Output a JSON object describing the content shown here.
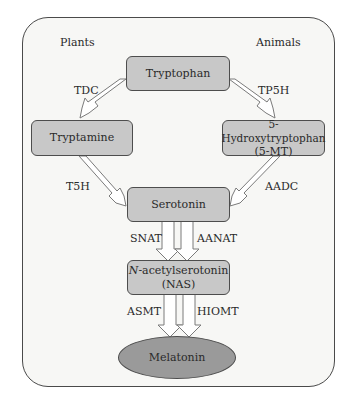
{
  "diagram": {
    "headers": {
      "left": "Plants",
      "right": "Animals"
    },
    "nodes": {
      "tryptophan": "Tryptophan",
      "tryptamine": "Tryptamine",
      "hydroxytryptophan_line1": "5-Hydroxytryptophan",
      "hydroxytryptophan_line2": "(5-MT)",
      "serotonin": "Serotonin",
      "nas_prefix": "N",
      "nas_line1_rest": "-acetylserotonin",
      "nas_line2": "(NAS)",
      "melatonin": "Melatonin"
    },
    "enzymes": {
      "tdc": "TDC",
      "tp5h": "TP5H",
      "t5h": "T5H",
      "aadc": "AADC",
      "snat": "SNAT",
      "aanat": "AANAT",
      "asmt": "ASMT",
      "hiomt": "HIOMT"
    },
    "edges": [
      {
        "from": "Tryptophan",
        "to": "Tryptamine",
        "enzyme": "TDC",
        "side": "Plants"
      },
      {
        "from": "Tryptophan",
        "to": "5-Hydroxytryptophan (5-MT)",
        "enzyme": "TP5H",
        "side": "Animals"
      },
      {
        "from": "Tryptamine",
        "to": "Serotonin",
        "enzyme": "T5H",
        "side": "Plants"
      },
      {
        "from": "5-Hydroxytryptophan (5-MT)",
        "to": "Serotonin",
        "enzyme": "AADC",
        "side": "Animals"
      },
      {
        "from": "Serotonin",
        "to": "N-acetylserotonin (NAS)",
        "enzyme": "SNAT",
        "side": "Plants"
      },
      {
        "from": "Serotonin",
        "to": "N-acetylserotonin (NAS)",
        "enzyme": "AANAT",
        "side": "Animals"
      },
      {
        "from": "N-acetylserotonin (NAS)",
        "to": "Melatonin",
        "enzyme": "ASMT",
        "side": "Plants"
      },
      {
        "from": "N-acetylserotonin (NAS)",
        "to": "Melatonin",
        "enzyme": "HIOMT",
        "side": "Animals"
      }
    ],
    "colors": {
      "box_fill": "#c8c8c8",
      "ellipse_fill": "#9a9a9a",
      "border": "#4d4d4d",
      "frame_bg": "#f7f7f5"
    }
  }
}
